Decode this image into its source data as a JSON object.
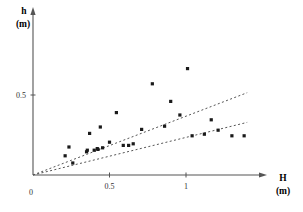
{
  "chart_data": {
    "type": "scatter",
    "title": "",
    "xlabel": "H",
    "xunit": "(m)",
    "ylabel": "h",
    "yunit": "(m)",
    "xlim": [
      0,
      1.75
    ],
    "ylim": [
      0,
      1.06
    ],
    "grid": false,
    "legend": "none",
    "xticks": [
      {
        "value": 0,
        "label": "0"
      },
      {
        "value": 0.5,
        "label": "0.5"
      },
      {
        "value": 1,
        "label": "1"
      }
    ],
    "yticks": [
      {
        "value": 0.5,
        "label": "0.5"
      }
    ],
    "origin_label": "0",
    "marker": {
      "shape": "square",
      "color": "#1a1a1a",
      "size": 3.2
    },
    "points": [
      {
        "x": 0.21,
        "y": 0.12
      },
      {
        "x": 0.235,
        "y": 0.175
      },
      {
        "x": 0.26,
        "y": 0.075
      },
      {
        "x": 0.35,
        "y": 0.145
      },
      {
        "x": 0.355,
        "y": 0.155
      },
      {
        "x": 0.37,
        "y": 0.26
      },
      {
        "x": 0.4,
        "y": 0.155
      },
      {
        "x": 0.42,
        "y": 0.165
      },
      {
        "x": 0.425,
        "y": 0.16
      },
      {
        "x": 0.44,
        "y": 0.3
      },
      {
        "x": 0.455,
        "y": 0.17
      },
      {
        "x": 0.5,
        "y": 0.205
      },
      {
        "x": 0.545,
        "y": 0.39
      },
      {
        "x": 0.59,
        "y": 0.185
      },
      {
        "x": 0.625,
        "y": 0.185
      },
      {
        "x": 0.655,
        "y": 0.195
      },
      {
        "x": 0.71,
        "y": 0.285
      },
      {
        "x": 0.78,
        "y": 0.57
      },
      {
        "x": 0.86,
        "y": 0.305
      },
      {
        "x": 0.9,
        "y": 0.46
      },
      {
        "x": 0.96,
        "y": 0.375
      },
      {
        "x": 1.01,
        "y": 0.665
      },
      {
        "x": 1.04,
        "y": 0.245
      },
      {
        "x": 1.12,
        "y": 0.255
      },
      {
        "x": 1.165,
        "y": 0.345
      },
      {
        "x": 1.21,
        "y": 0.28
      },
      {
        "x": 1.3,
        "y": 0.245
      },
      {
        "x": 1.38,
        "y": 0.245
      }
    ],
    "trend_lines": [
      {
        "name": "upper-fit-line",
        "style": "dashed",
        "slope": 0.3675,
        "intercept": 0,
        "x_start": 0.0,
        "x_end": 1.4
      },
      {
        "name": "lower-fit-line",
        "style": "dashed",
        "slope": 0.235,
        "intercept": 0,
        "x_start": 0.0,
        "x_end": 1.4
      }
    ],
    "axis_color": "#555555",
    "line_color": "#555555"
  }
}
